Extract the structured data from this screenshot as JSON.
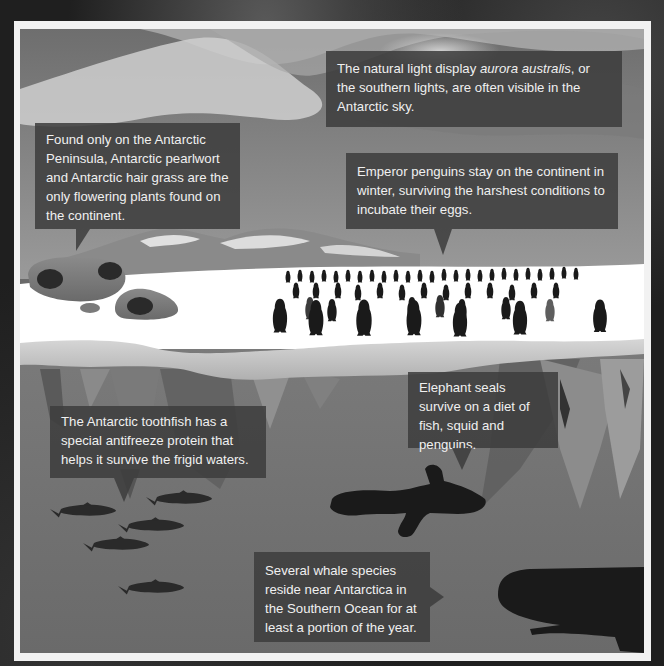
{
  "infographic": {
    "subject": "Antarctic ecosystem",
    "colors": {
      "background": "#1f1f1f",
      "frame": "#f2f2f2",
      "callout": "#3c3c3c",
      "callout_text": "#f0f0f0",
      "sky": "#8c8c8c",
      "ice": "#ffffff",
      "water": "#6a6a6a",
      "silhouette": "#1a1a1a"
    },
    "callouts": [
      {
        "id": "aurora",
        "text_before": "The natural light display ",
        "text_italic": "aurora australis",
        "text_after": ", or the southern lights, are often visible in the Antarctic sky."
      },
      {
        "id": "plants",
        "text": "Found only on the Antarctic Peninsula, Antarctic pearlwort and Antarctic hair grass are the only flowering plants found on the continent."
      },
      {
        "id": "penguins",
        "text": "Emperor penguins stay on the continent in winter, surviving the harshest conditions to incubate their eggs."
      },
      {
        "id": "seals",
        "text": "Elephant seals survive on a diet of fish, squid and penguins."
      },
      {
        "id": "toothfish",
        "text": "The Antarctic toothfish has a special antifreeze protein that helps it survive the frigid waters."
      },
      {
        "id": "whales",
        "text": "Several whale species reside near Antarctica in the Southern Ocean for at least a portion of the year."
      }
    ],
    "illustrations": [
      "aurora-sky",
      "mountain-range",
      "moss-covered-rocks",
      "emperor-penguin-colony",
      "ice-shelf",
      "icebergs-underwater",
      "elephant-seal-silhouette",
      "toothfish-school",
      "sperm-whale-silhouette"
    ]
  }
}
